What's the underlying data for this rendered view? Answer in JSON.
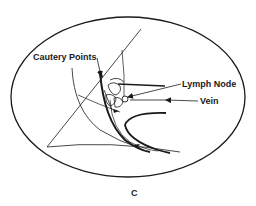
{
  "figure": {
    "panel_label": "C",
    "labels": {
      "cautery_points": "Cautery Points",
      "lymph_node": "Lymph Node",
      "vein": "Vein"
    },
    "colors": {
      "ink": "#1a1a1a",
      "background": "#ffffff"
    }
  }
}
